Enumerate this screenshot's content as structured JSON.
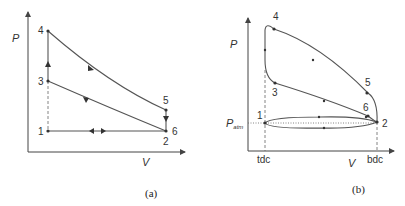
{
  "diagram_a": {
    "caption": "(a)",
    "y_axis_label": "P",
    "x_axis_label": "V",
    "points": [
      {
        "id": "1",
        "label": "1"
      },
      {
        "id": "2",
        "label": "2"
      },
      {
        "id": "3",
        "label": "3"
      },
      {
        "id": "4",
        "label": "4"
      },
      {
        "id": "5",
        "label": "5"
      },
      {
        "id": "6",
        "label": "6"
      }
    ]
  },
  "diagram_b": {
    "caption": "(b)",
    "y_axis_label": "P",
    "x_axis_label": "V",
    "p_atm_label": "P",
    "p_atm_subscript": "atm",
    "tdc_label": "tdc",
    "bdc_label": "bdc",
    "points": [
      {
        "id": "1",
        "label": "1"
      },
      {
        "id": "2",
        "label": "2"
      },
      {
        "id": "3",
        "label": "3"
      },
      {
        "id": "4",
        "label": "4"
      },
      {
        "id": "5",
        "label": "5"
      },
      {
        "id": "6",
        "label": "6"
      }
    ]
  }
}
